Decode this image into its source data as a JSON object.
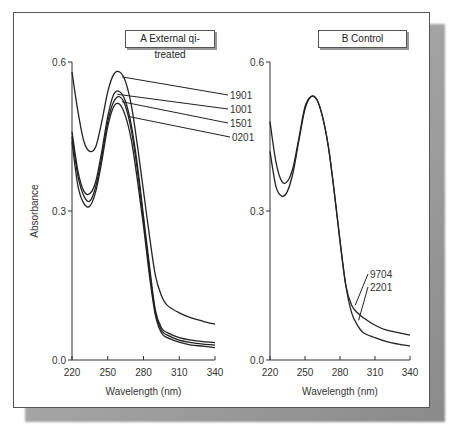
{
  "chart_data": [
    {
      "type": "line",
      "title": "A External qi-treated",
      "xlabel": "Wavelength (nm)",
      "ylabel": "Absorbance",
      "xlim": [
        220,
        340
      ],
      "ylim": [
        0.0,
        0.6
      ],
      "xticks": [
        "220",
        "250",
        "280",
        "310",
        "340"
      ],
      "yticks": [
        "0.0",
        "0.3",
        "0.6"
      ],
      "grid": false,
      "series": [
        {
          "name": "1901",
          "x": [
            220,
            225,
            230,
            235,
            240,
            245,
            250,
            255,
            260,
            265,
            270,
            275,
            280,
            285,
            290,
            295,
            300,
            310,
            320,
            330,
            340
          ],
          "values": [
            0.58,
            0.5,
            0.44,
            0.42,
            0.43,
            0.48,
            0.54,
            0.575,
            0.58,
            0.56,
            0.51,
            0.43,
            0.34,
            0.25,
            0.17,
            0.13,
            0.11,
            0.095,
            0.085,
            0.078,
            0.072
          ]
        },
        {
          "name": "1001",
          "x": [
            220,
            225,
            230,
            235,
            240,
            245,
            250,
            255,
            260,
            265,
            270,
            275,
            280,
            285,
            290,
            295,
            300,
            310,
            320,
            330,
            340
          ],
          "values": [
            0.46,
            0.38,
            0.34,
            0.335,
            0.36,
            0.42,
            0.49,
            0.535,
            0.54,
            0.52,
            0.47,
            0.39,
            0.29,
            0.19,
            0.1,
            0.065,
            0.055,
            0.045,
            0.04,
            0.037,
            0.035
          ]
        },
        {
          "name": "1501",
          "x": [
            220,
            225,
            230,
            235,
            240,
            245,
            250,
            255,
            260,
            265,
            270,
            275,
            280,
            285,
            290,
            295,
            300,
            310,
            320,
            330,
            340
          ],
          "values": [
            0.45,
            0.37,
            0.33,
            0.32,
            0.35,
            0.41,
            0.48,
            0.52,
            0.53,
            0.51,
            0.46,
            0.38,
            0.28,
            0.18,
            0.095,
            0.06,
            0.05,
            0.04,
            0.035,
            0.032,
            0.03
          ]
        },
        {
          "name": "0201",
          "x": [
            220,
            225,
            230,
            235,
            240,
            245,
            250,
            255,
            260,
            265,
            270,
            275,
            280,
            285,
            290,
            295,
            300,
            310,
            320,
            330,
            340
          ],
          "values": [
            0.44,
            0.35,
            0.315,
            0.31,
            0.34,
            0.4,
            0.47,
            0.51,
            0.515,
            0.49,
            0.44,
            0.36,
            0.27,
            0.17,
            0.09,
            0.055,
            0.045,
            0.036,
            0.03,
            0.028,
            0.025
          ]
        }
      ]
    },
    {
      "type": "line",
      "title": "B Control",
      "xlabel": "Wavelength (nm)",
      "ylabel": "",
      "xlim": [
        220,
        340
      ],
      "ylim": [
        0.0,
        0.6
      ],
      "xticks": [
        "220",
        "250",
        "280",
        "310",
        "340"
      ],
      "yticks": [
        "0.0",
        "0.3",
        "0.6"
      ],
      "grid": false,
      "series": [
        {
          "name": "9704",
          "x": [
            220,
            225,
            230,
            235,
            240,
            245,
            250,
            255,
            260,
            265,
            270,
            275,
            280,
            285,
            290,
            295,
            300,
            310,
            320,
            330,
            340
          ],
          "values": [
            0.48,
            0.4,
            0.36,
            0.36,
            0.39,
            0.45,
            0.51,
            0.53,
            0.525,
            0.49,
            0.43,
            0.34,
            0.24,
            0.15,
            0.11,
            0.095,
            0.085,
            0.07,
            0.06,
            0.055,
            0.05
          ]
        },
        {
          "name": "2201",
          "x": [
            220,
            225,
            230,
            235,
            240,
            245,
            250,
            255,
            260,
            265,
            270,
            275,
            280,
            285,
            290,
            295,
            300,
            310,
            320,
            330,
            340
          ],
          "values": [
            0.42,
            0.35,
            0.33,
            0.34,
            0.38,
            0.445,
            0.505,
            0.53,
            0.525,
            0.49,
            0.43,
            0.34,
            0.24,
            0.15,
            0.095,
            0.07,
            0.055,
            0.045,
            0.037,
            0.032,
            0.028
          ]
        }
      ]
    }
  ],
  "panels": [
    {
      "label": "A External qi-treated",
      "y_axis_label": "Absorbance",
      "x_axis_label": "Wavelength (nm)"
    },
    {
      "label": "B Control",
      "x_axis_label": "Wavelength (nm)"
    }
  ]
}
